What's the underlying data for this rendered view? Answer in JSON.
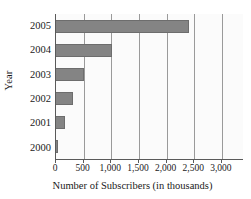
{
  "chart_data": {
    "type": "bar",
    "orientation": "horizontal",
    "title": "",
    "xlabel": "Number of Subscribers (in thousands)",
    "ylabel": "Year",
    "categories": [
      "2005",
      "2004",
      "2003",
      "2002",
      "2001",
      "2000"
    ],
    "values": [
      2400,
      1020,
      500,
      310,
      165,
      25
    ],
    "xlim": [
      0,
      3400
    ],
    "ylim": null,
    "xticks": [
      0,
      500,
      1000,
      1500,
      2000,
      2500,
      3000
    ],
    "xtick_labels": [
      "0",
      "500",
      "1,000",
      "1,500",
      "2,000",
      "2,500",
      "3,000"
    ],
    "ytick_labels": [
      "2005",
      "2004",
      "2003",
      "2002",
      "2001",
      "2000"
    ],
    "grid": "vertical",
    "legend": null,
    "bar_color": "#848484",
    "bar_edge_color": "#6d6d6d",
    "axis_color": "#5a5a5a",
    "gridline_color": "#9a9a9a",
    "plot_background": "#fbfbfb"
  }
}
